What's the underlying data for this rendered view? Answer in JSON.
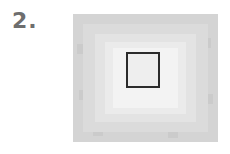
{
  "figure": {
    "label": "2.",
    "colors": {
      "label": "#6e6e6e",
      "outer": "#d4d4d4",
      "center": "#f3f3f3",
      "box_border": "#2b2b2b"
    }
  }
}
